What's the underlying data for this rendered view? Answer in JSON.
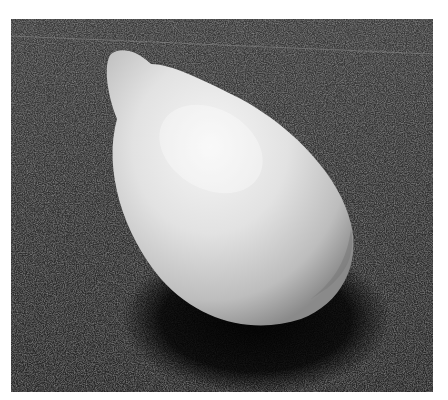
{
  "image": {
    "subject": "seed-kernel",
    "description": "Grayscale photograph of a white teardrop-shaped seed on a dark textured surface",
    "colors": {
      "background_page": "#ffffff",
      "surface_dark": "#2a2a2a",
      "seed_highlight": "#f4f4f4",
      "seed_mid": "#cfcfcf",
      "shadow": "#050505"
    }
  }
}
